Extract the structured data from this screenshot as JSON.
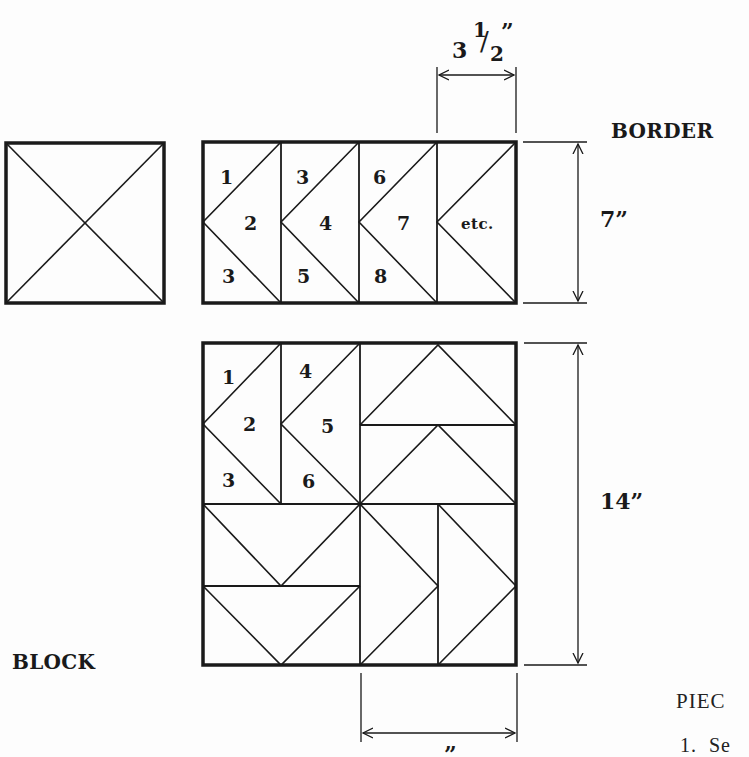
{
  "labels": {
    "border_title": "BORDER",
    "block_title": "BLOCK",
    "border_width_dim": {
      "whole": "3",
      "numerator": "1",
      "slash": "/",
      "denominator": "2",
      "unit": "”"
    },
    "border_height_dim": "7”",
    "block_height_dim": "14”",
    "bottom_dim_partial": "”",
    "piecing_heading_partial": "PIEC",
    "step_partial": "1.  Se"
  },
  "border": {
    "pieces": [
      "1",
      "2",
      "3",
      "3",
      "4",
      "5",
      "6",
      "7",
      "8",
      "etc."
    ]
  },
  "block": {
    "pieces": [
      "1",
      "2",
      "3",
      "4",
      "5",
      "6"
    ]
  },
  "colors": {
    "ink": "#1a1a1a",
    "paper": "#fdfdfd"
  }
}
